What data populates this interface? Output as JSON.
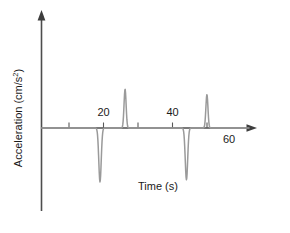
{
  "chart_data": {
    "type": "line",
    "title": "",
    "xlabel": "Time (s)",
    "ylabel": "Acceleration (cm/s²)",
    "ylabel_unit_base": "Acceleration (cm/s",
    "ylabel_unit_exp": "2",
    "ylabel_unit_close": ")",
    "xlim": [
      0,
      72
    ],
    "ylim": [
      -1.25,
      1.05
    ],
    "grid": false,
    "legend": null,
    "x_ticks": [
      10,
      20,
      30,
      40,
      50
    ],
    "x_tick_labels": [
      "",
      "20",
      "",
      "40",
      ""
    ],
    "extra_labels": [
      {
        "text": "60",
        "x": 60,
        "position": "below-axis"
      }
    ],
    "axis_arrows": {
      "x": "right",
      "y": "up"
    },
    "series": [
      {
        "name": "acceleration",
        "color": "#9a9a9a",
        "description": "Flat baseline at zero interrupted by four narrow spikes",
        "peaks": [
          {
            "label": "spike-1",
            "x": 20.3,
            "amplitude": -1.0,
            "direction": "down",
            "width": 1.0
          },
          {
            "label": "spike-2",
            "x": 29.0,
            "amplitude": 0.72,
            "direction": "up",
            "width": 0.85
          },
          {
            "label": "spike-3",
            "x": 50.3,
            "amplitude": -0.96,
            "direction": "down",
            "width": 1.0
          },
          {
            "label": "spike-4",
            "x": 57.4,
            "amplitude": 0.62,
            "direction": "up",
            "width": 0.85
          }
        ]
      }
    ]
  },
  "figure": {
    "background_color": "#ffffff",
    "axis_color": "#4d4d4d",
    "trace_color": "#9a9a9a",
    "text_color": "#1a1a1a"
  }
}
